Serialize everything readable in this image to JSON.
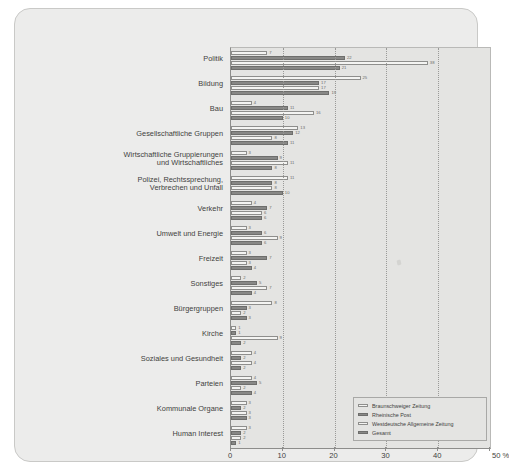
{
  "chart_data": {
    "type": "bar",
    "orientation": "horizontal",
    "title": "",
    "xlabel": "%",
    "ylabel": "",
    "xlim": [
      0,
      50
    ],
    "xticks": [
      0,
      10,
      20,
      30,
      40,
      50
    ],
    "xtick_labels": [
      "0",
      "10",
      "20",
      "30",
      "40",
      "50"
    ],
    "x_unit_label": "50 %",
    "grid": "vertical dotted gridlines at 10, 20, 30, 40",
    "legend_position": "bottom-right inside plot",
    "categories": [
      "Politik",
      "Bildung",
      "Bau",
      "Gesellschaftliche Gruppen",
      "Wirtschaftliche Gruppierungen\nund Wirtschaftliches",
      "Polizei, Rechtssprechung,\nVerbrechen und Unfall",
      "Verkehr",
      "Umwelt und Energie",
      "Freizeit",
      "Sonstiges",
      "Bürgergruppen",
      "Kirche",
      "Soziales und Gesundheit",
      "Parteien",
      "Kommunale Organe",
      "Human Interest"
    ],
    "series": [
      {
        "name": "Braunschweiger Zeitung",
        "style": "light",
        "values": [
          7,
          25,
          4,
          13,
          3,
          11,
          4,
          3,
          3,
          2,
          8,
          1,
          4,
          4,
          3,
          3
        ]
      },
      {
        "name": "Rheinische Post",
        "style": "dark",
        "values": [
          22,
          17,
          11,
          12,
          9,
          8,
          7,
          6,
          7,
          5,
          3,
          1,
          2,
          5,
          2,
          2
        ]
      },
      {
        "name": "Westdeutsche Allgemeine Zeitung",
        "style": "light",
        "values": [
          38,
          17,
          16,
          8,
          11,
          8,
          6,
          9,
          3,
          7,
          2,
          9,
          4,
          2,
          3,
          2
        ]
      },
      {
        "name": "Gesamt",
        "style": "dark",
        "values": [
          21,
          19,
          10,
          11,
          8,
          10,
          6,
          6,
          4,
          4,
          3,
          2,
          2,
          4,
          3,
          1
        ]
      }
    ]
  },
  "legend": {
    "items": [
      {
        "label": "Braunschweiger Zeitung",
        "style": "light"
      },
      {
        "label": "Rheinische Post",
        "style": "dark"
      },
      {
        "label": "Westdeutsche Allgemeine Zeitung",
        "style": "light"
      },
      {
        "label": "Gesamt",
        "style": "dark"
      }
    ]
  },
  "colors": {
    "page_background": "#ffffff",
    "panel_background": "#ececeb",
    "plot_background": "#e4e4e2",
    "bar_light_fill": "#f4f4f2",
    "bar_light_stroke": "#8e8e8c",
    "bar_dark_fill": "#888886",
    "bar_dark_stroke": "#6e6e6c",
    "axis": "#8d8d8b",
    "gridline": "#9a9a98",
    "text": "#3f3f3d"
  }
}
